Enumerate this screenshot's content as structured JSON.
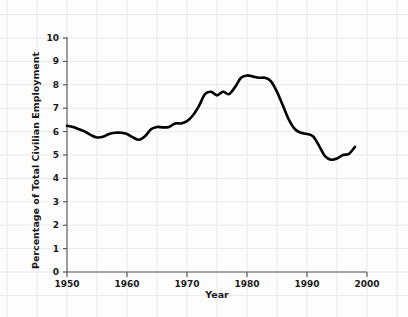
{
  "chart_data": {
    "type": "line",
    "title": "",
    "xlabel": "Year",
    "ylabel": "Percentage of Total Civilian Employment",
    "xlim": [
      1950,
      2000
    ],
    "ylim": [
      0,
      10
    ],
    "xticks": [
      "1950",
      "1960",
      "1970",
      "1980",
      "1990",
      "2000"
    ],
    "xtick_values": [
      1950,
      1960,
      1970,
      1980,
      1990,
      2000
    ],
    "yticks": [
      "0",
      "1",
      "2",
      "3",
      "4",
      "5",
      "6",
      "7",
      "8",
      "9",
      "10"
    ],
    "ytick_values": [
      0,
      1,
      2,
      3,
      4,
      5,
      6,
      7,
      8,
      9,
      10
    ],
    "grid": true,
    "legend": null,
    "line_color": "#000000",
    "line_width": 2.6,
    "background_color": "#fdfdfd",
    "grid_color": "#e9e9ef",
    "axis_color": "#555555",
    "x": [
      1950,
      1951,
      1952,
      1953,
      1954,
      1955,
      1956,
      1957,
      1958,
      1959,
      1960,
      1961,
      1962,
      1963,
      1964,
      1965,
      1966,
      1967,
      1968,
      1969,
      1970,
      1971,
      1972,
      1973,
      1974,
      1975,
      1976,
      1977,
      1978,
      1979,
      1980,
      1981,
      1982,
      1983,
      1984,
      1985,
      1986,
      1987,
      1988,
      1989,
      1990,
      1991,
      1992,
      1993,
      1994,
      1995,
      1996,
      1997,
      1998
    ],
    "y": [
      6.25,
      6.2,
      6.1,
      6.0,
      5.85,
      5.75,
      5.78,
      5.9,
      5.95,
      5.95,
      5.9,
      5.75,
      5.65,
      5.8,
      6.1,
      6.2,
      6.18,
      6.2,
      6.35,
      6.35,
      6.45,
      6.7,
      7.1,
      7.6,
      7.7,
      7.55,
      7.7,
      7.6,
      7.9,
      8.3,
      8.4,
      8.35,
      8.3,
      8.3,
      8.15,
      7.7,
      7.1,
      6.5,
      6.1,
      5.95,
      5.9,
      5.8,
      5.4,
      4.95,
      4.8,
      4.85,
      5.0,
      5.05,
      5.35
    ],
    "series": [
      {
        "name": "Percentage of Total Civilian Employment",
        "values": [
          6.25,
          6.2,
          6.1,
          6.0,
          5.85,
          5.75,
          5.78,
          5.9,
          5.95,
          5.95,
          5.9,
          5.75,
          5.65,
          5.8,
          6.1,
          6.2,
          6.18,
          6.2,
          6.35,
          6.35,
          6.45,
          6.7,
          7.1,
          7.6,
          7.7,
          7.55,
          7.7,
          7.6,
          7.9,
          8.3,
          8.4,
          8.35,
          8.3,
          8.3,
          8.15,
          7.7,
          7.1,
          6.5,
          6.1,
          5.95,
          5.9,
          5.8,
          5.4,
          4.95,
          4.8,
          4.85,
          5.0,
          5.05,
          5.35
        ]
      }
    ],
    "annotations": []
  }
}
